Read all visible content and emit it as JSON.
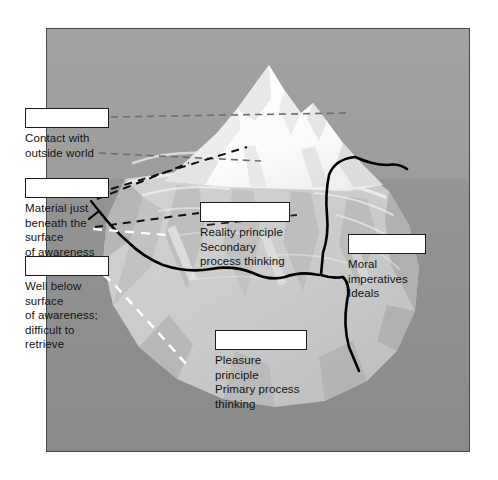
{
  "figure": {
    "frame_border_color": "#4a4a4a",
    "palette": {
      "sky": "#9a9a9a",
      "water": "#8d8d8d",
      "ice_above_water": "#fdfdfd",
      "ice_shadow": "#d6d6d6",
      "ice_below_water": "#c9c9c9",
      "ice_below_shadow": "#b4b4b4",
      "boundary_line": "#000000",
      "leader_line": "#6e6e6e",
      "unconscious_leader_line": "#ffffff"
    }
  },
  "callouts": [
    {
      "id": "conscious",
      "name": "conscious-level",
      "answer": "",
      "description": "Contact with\noutside world",
      "leader": "dashed-gray"
    },
    {
      "id": "preconscious",
      "name": "preconscious-level",
      "answer": "",
      "description": "Material just\nbeneath the surface\nof awareness",
      "leader": "dashed-black"
    },
    {
      "id": "unconscious",
      "name": "unconscious-level",
      "answer": "",
      "description": "Well below surface\nof awareness;\ndifficult to retrieve",
      "leader": "dashed-white"
    },
    {
      "id": "ego",
      "name": "ego-structure",
      "answer": "",
      "description": "Reality principle\nSecondary\nprocess thinking",
      "leader": "none"
    },
    {
      "id": "superego",
      "name": "superego-structure",
      "answer": "",
      "description": "Moral\nimperatives\nIdeals",
      "leader": "none"
    },
    {
      "id": "id",
      "name": "id-structure",
      "answer": "",
      "description": "Pleasure principle\nPrimary process\nthinking",
      "leader": "none"
    }
  ]
}
